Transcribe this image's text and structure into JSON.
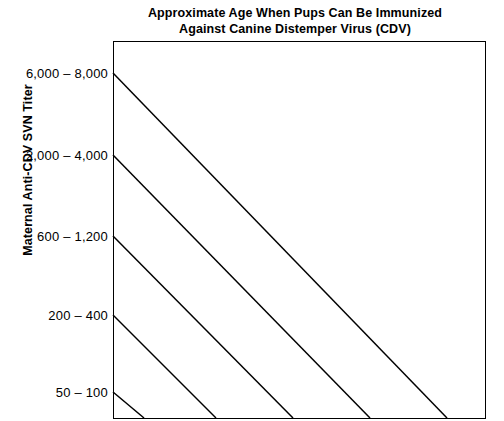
{
  "title": {
    "line1": "Approximate Age When Pups Can Be Immunized",
    "line2": "Against Canine Distemper Virus (CDV)"
  },
  "axes": {
    "y_title": "Maternal Anti-CDV SVN Titer"
  },
  "ticks": {
    "t0": "6,000 – 8,000",
    "t1": "2,000 – 4,000",
    "t2": "600 – 1,200",
    "t3": "200 – 400",
    "t4": "50 – 100"
  },
  "style": {
    "line_color": "#000000",
    "axis_color": "#000000",
    "background": "#ffffff"
  },
  "chart_data": {
    "type": "line",
    "title": "Approximate Age When Pups Can Be Immunized Against Canine Distemper Virus (CDV)",
    "xlabel": "",
    "ylabel": "Maternal Anti-CDV SVN Titer",
    "ytick_labels": [
      "6,000 – 8,000",
      "2,000 – 4,000",
      "600 – 1,200",
      "200 – 400",
      "50 – 100"
    ],
    "ytick_pixel_y": [
      73,
      155,
      236,
      315,
      392
    ],
    "ylim_categories_top_to_bottom": [
      "6,000 – 8,000",
      "2,000 – 4,000",
      "600 – 1,200",
      "200 – 400",
      "50 – 100"
    ],
    "xtick_labels": [],
    "grid": false,
    "legend": "none",
    "series": [
      {
        "name": "Maternal antibody decay from titer 6,000 – 8,000",
        "points": [
          [
            113,
            73
          ],
          [
            447,
            418
          ]
        ]
      },
      {
        "name": "Maternal antibody decay from titer 2,000 – 4,000",
        "points": [
          [
            113,
            155
          ],
          [
            370,
            418
          ]
        ]
      },
      {
        "name": "Maternal antibody decay from titer 600 – 1,200",
        "points": [
          [
            113,
            236
          ],
          [
            293,
            418
          ]
        ]
      },
      {
        "name": "Maternal antibody decay from titer 200 – 400",
        "points": [
          [
            113,
            315
          ],
          [
            216,
            418
          ]
        ]
      },
      {
        "name": "Maternal antibody decay from titer 50 – 100",
        "points": [
          [
            113,
            392
          ],
          [
            144,
            418
          ]
        ]
      }
    ]
  }
}
